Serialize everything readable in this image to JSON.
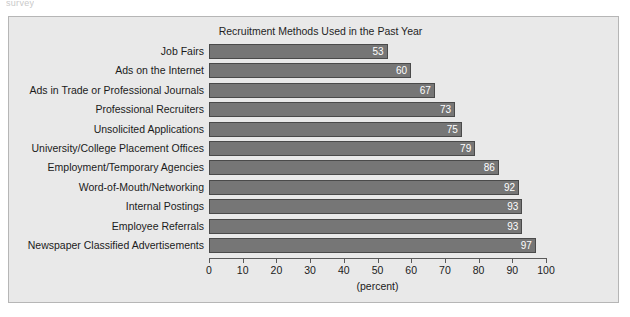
{
  "page": {
    "top_fragment": "survey"
  },
  "chart_data": {
    "type": "bar",
    "orientation": "horizontal",
    "title": "Recruitment Methods Used in the Past Year",
    "xlabel": "(percent)",
    "ylabel": "",
    "xlim": [
      0,
      100
    ],
    "xticks": [
      0,
      10,
      20,
      30,
      40,
      50,
      60,
      70,
      80,
      90,
      100
    ],
    "grid": false,
    "legend": null,
    "bar_color": "#767676",
    "bar_edge_color": "#4a4a4a",
    "value_label_color": "#ffffff",
    "background_color": "#e9e9e9",
    "categories": [
      "Job Fairs",
      "Ads on the Internet",
      "Ads in Trade or Professional Journals",
      "Professional Recruiters",
      "Unsolicited Applications",
      "University/College Placement Offices",
      "Employment/Temporary Agencies",
      "Word-of-Mouth/Networking",
      "Internal Postings",
      "Employee Referrals",
      "Newspaper Classified Advertisements"
    ],
    "values": [
      53,
      60,
      67,
      73,
      75,
      79,
      86,
      92,
      93,
      93,
      97
    ]
  }
}
